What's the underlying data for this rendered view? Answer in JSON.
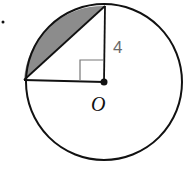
{
  "figure": {
    "type": "geometry",
    "circle": {
      "center": "O",
      "radius_label": "4"
    },
    "labels": {
      "radius": "4",
      "center": "O"
    },
    "markers": {
      "right_angle": true,
      "bullet": "•"
    },
    "colors": {
      "stroke": "#111111",
      "shaded_segment": "#8c8c8c",
      "right_angle_marker": "#777777",
      "radius_label": "#6a6a6a"
    }
  }
}
